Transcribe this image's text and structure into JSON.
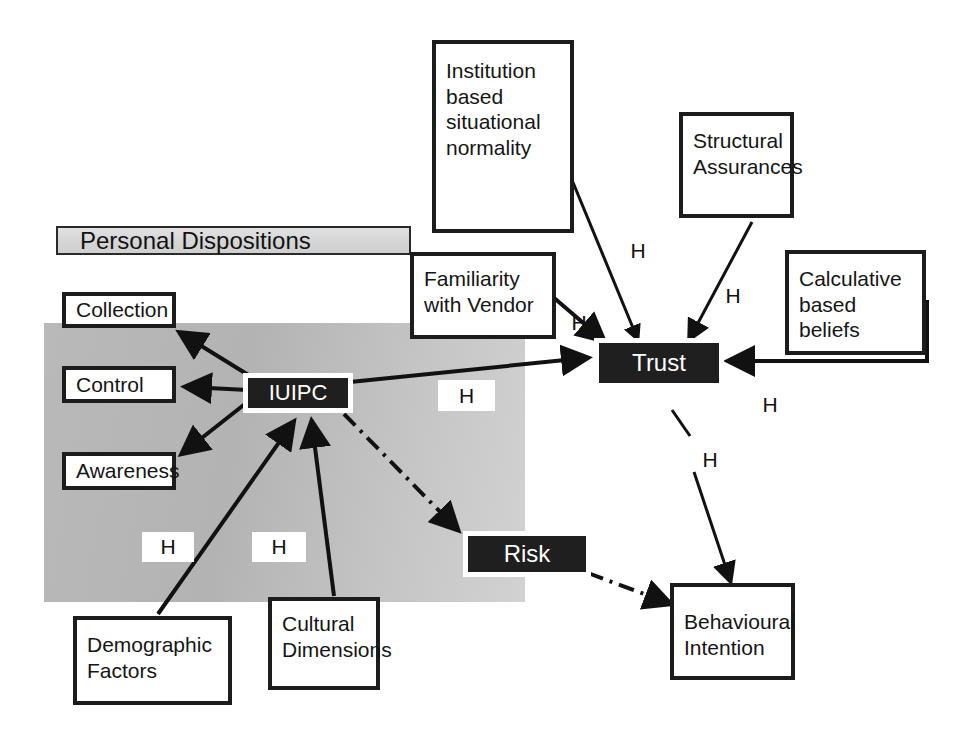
{
  "diagram": {
    "region": {
      "banner_label": "Personal Dispositions",
      "shaded_area_name": "personal-dispositions-region"
    },
    "nodes": [
      {
        "id": "institution",
        "label": "Institution\nbased\nsituational\nnormality",
        "style": "light"
      },
      {
        "id": "structural",
        "label": "Structural\nAssurances",
        "style": "light"
      },
      {
        "id": "calculative",
        "label": "Calculative\nbased beliefs",
        "style": "light"
      },
      {
        "id": "familiarity",
        "label": "Familiarity\nwith Vendor",
        "style": "light"
      },
      {
        "id": "collection",
        "label": "Collection",
        "style": "light"
      },
      {
        "id": "control",
        "label": "Control",
        "style": "light"
      },
      {
        "id": "awareness",
        "label": "Awareness",
        "style": "light"
      },
      {
        "id": "iuipc",
        "label": "IUIPC",
        "style": "dark"
      },
      {
        "id": "trust",
        "label": "Trust",
        "style": "dark"
      },
      {
        "id": "risk",
        "label": "Risk",
        "style": "dark"
      },
      {
        "id": "demographic",
        "label": "Demographic\nFactors",
        "style": "light"
      },
      {
        "id": "cultural",
        "label": "Cultural\nDimensions",
        "style": "light"
      },
      {
        "id": "behavioural",
        "label": "Behavioural\nIntention",
        "style": "light"
      }
    ],
    "hypothesis_labels": [
      {
        "id": "h-institution-trust",
        "label": "H"
      },
      {
        "id": "h-structural-trust",
        "label": "H"
      },
      {
        "id": "h-familiarity-trust",
        "label": "H"
      },
      {
        "id": "h-iuipc-trust",
        "label": "H"
      },
      {
        "id": "h-calculative-trust",
        "label": "H"
      },
      {
        "id": "h-trust-behavioural",
        "label": "H"
      },
      {
        "id": "h-demographic-iuipc",
        "label": "H"
      },
      {
        "id": "h-cultural-iuipc",
        "label": "H"
      }
    ],
    "edges": [
      {
        "from": "institution",
        "to": "trust",
        "style": "solid-arrow"
      },
      {
        "from": "structural",
        "to": "trust",
        "style": "solid-arrow"
      },
      {
        "from": "calculative",
        "to": "trust",
        "style": "solid-arrow"
      },
      {
        "from": "familiarity",
        "to": "trust",
        "style": "solid-arrow"
      },
      {
        "from": "iuipc",
        "to": "trust",
        "style": "solid-arrow"
      },
      {
        "from": "iuipc",
        "to": "collection",
        "style": "solid-arrow"
      },
      {
        "from": "iuipc",
        "to": "control",
        "style": "solid-arrow"
      },
      {
        "from": "iuipc",
        "to": "awareness",
        "style": "solid-arrow"
      },
      {
        "from": "iuipc",
        "to": "risk",
        "style": "dash-dot-arrow"
      },
      {
        "from": "risk",
        "to": "behavioural",
        "style": "dash-dot-arrow"
      },
      {
        "from": "trust",
        "to": "behavioural",
        "style": "solid-arrow"
      },
      {
        "from": "demographic",
        "to": "iuipc",
        "style": "solid-arrow"
      },
      {
        "from": "cultural",
        "to": "iuipc",
        "style": "solid-arrow"
      }
    ],
    "colors": {
      "node_fill_light": "#ffffff",
      "node_fill_dark": "#1f1f1f",
      "node_border": "#1c1c1c",
      "region_fill": "#bcbcbc",
      "banner_fill": "#d8d8d8",
      "line": "#111111",
      "text_light": "#151515",
      "text_dark": "#ffffff"
    }
  }
}
